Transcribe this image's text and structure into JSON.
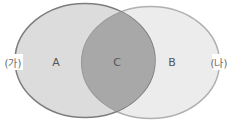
{
  "diagram": {
    "type": "venn",
    "sets": [
      {
        "id": "left",
        "outer_label": "(가)",
        "region_label": "A",
        "fill": "#dcdcdc",
        "stroke": "#7d7d7d"
      },
      {
        "id": "right",
        "outer_label": "(나)",
        "region_label": "B",
        "fill": "#ececec",
        "stroke": "#b0b0b0"
      }
    ],
    "intersection": {
      "region_label": "C",
      "fill": "#a8a8a8"
    }
  }
}
